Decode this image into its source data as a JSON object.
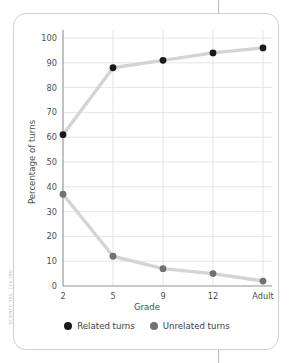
{
  "source_credit": "SCIENCE  305, 174-180",
  "chart_data": {
    "type": "line",
    "title": "",
    "xlabel": "Grade",
    "ylabel": "Percentage of turns",
    "categories": [
      "2",
      "5",
      "9",
      "12",
      "Adult"
    ],
    "ylim": [
      0,
      100
    ],
    "yticks": [
      0,
      10,
      20,
      30,
      40,
      50,
      60,
      70,
      80,
      90,
      100
    ],
    "ytick_labels": [
      "0",
      "10",
      "20",
      "30",
      "40",
      "50",
      "60",
      "70",
      "80",
      "90",
      "100"
    ],
    "grid": true,
    "legend_position": "bottom",
    "series": [
      {
        "name": "Related turns",
        "color": "#1a1a1a",
        "values": [
          61,
          88,
          91,
          94,
          96
        ]
      },
      {
        "name": "Unrelated turns",
        "color": "#6e7275",
        "values": [
          37,
          12,
          7,
          5,
          2
        ]
      }
    ],
    "line_color": "#d2d4d6"
  }
}
